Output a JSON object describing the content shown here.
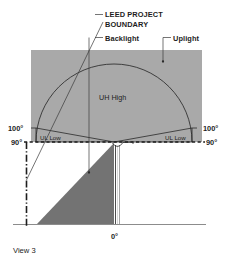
{
  "figure": {
    "caption": "View 3",
    "callouts": {
      "leed_line1": "LEED PROJECT",
      "leed_line2": "BOUNDARY",
      "backlight": "Backlight",
      "uplight": "Uplight"
    },
    "zones": {
      "uh_high": "UH High",
      "ul_low_left": "UL Low",
      "ul_low_right": "UL Low"
    },
    "angles": {
      "left_upper": "100°",
      "left_lower": "90°",
      "right_upper": "100°",
      "right_lower": "90°",
      "bottom": "0°"
    },
    "colors": {
      "sky_fill": "#a9a9a9",
      "shadow_fill": "#737373",
      "stroke": "#2a2a2a",
      "leader": "#3a3a3a",
      "text": "#1d1d1d",
      "ground": "#8c8c8c"
    }
  }
}
